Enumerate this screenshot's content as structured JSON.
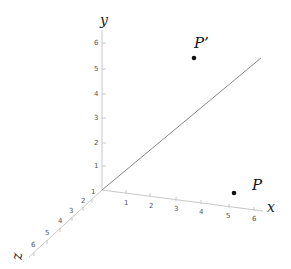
{
  "diagram": {
    "axes": {
      "x": {
        "label": "x",
        "ticks": [
          "1",
          "2",
          "3",
          "4",
          "5",
          "6"
        ]
      },
      "y": {
        "label": "y",
        "ticks": [
          "1",
          "2",
          "3",
          "4",
          "5",
          "6"
        ]
      },
      "z": {
        "label": "z",
        "ticks": [
          "1",
          "2",
          "3",
          "4",
          "5",
          "6"
        ]
      }
    },
    "points": [
      {
        "name": "P",
        "label": "P"
      },
      {
        "name": "P-prime",
        "label": "P’"
      }
    ],
    "line": {
      "description": "diagonal line through origin"
    }
  }
}
